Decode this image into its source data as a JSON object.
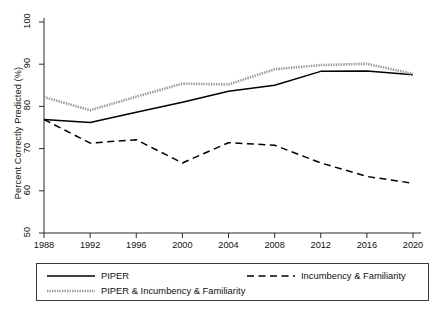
{
  "chart_data": {
    "type": "line",
    "title": "",
    "xlabel": "",
    "ylabel": "Percent Correctly Predicted (%)",
    "x": [
      1988,
      1992,
      1996,
      2000,
      2004,
      2008,
      2012,
      2016,
      2020
    ],
    "xticklabels": [
      "1988",
      "1992",
      "1996",
      "2000",
      "2004",
      "2008",
      "2012",
      "2016",
      "2020"
    ],
    "yticklabels": [
      "50",
      "60",
      "70",
      "80",
      "90",
      "100"
    ],
    "yticks": [
      50,
      60,
      70,
      80,
      90,
      100
    ],
    "xlim": [
      1988,
      2020
    ],
    "ylim": [
      50,
      100
    ],
    "grid": false,
    "legend_position": "below-axes",
    "series": [
      {
        "name": "PIPER",
        "style": "solid",
        "color": "#000000",
        "values": [
          76.9,
          76.2,
          78.6,
          81.0,
          83.6,
          85.0,
          88.3,
          88.4,
          87.5
        ]
      },
      {
        "name": "Incumbency & Familiarity",
        "style": "dashed",
        "color": "#000000",
        "values": [
          76.9,
          71.3,
          72.1,
          66.6,
          71.4,
          70.8,
          66.6,
          63.4,
          61.8
        ]
      },
      {
        "name": "PIPER & Incumbency & Familiarity",
        "style": "dotted",
        "color": "#9a9a9a",
        "values": [
          82.2,
          79.1,
          82.3,
          85.4,
          85.2,
          88.8,
          89.8,
          90.1,
          87.7
        ]
      }
    ]
  },
  "legend": {
    "items": [
      {
        "label": "PIPER",
        "style": "solid"
      },
      {
        "label": "Incumbency & Familiarity",
        "style": "dashed"
      },
      {
        "label": "PIPER & Incumbency & Familiarity",
        "style": "dotted"
      }
    ]
  }
}
